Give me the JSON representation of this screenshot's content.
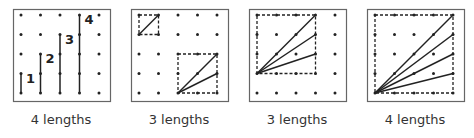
{
  "panels": [
    {
      "caption": "4 lengths",
      "segments": [
        {
          "from": [
            0,
            3
          ],
          "to": [
            0,
            4
          ],
          "label": "1"
        },
        {
          "from": [
            1,
            2
          ],
          "to": [
            1,
            4
          ],
          "label": "2"
        },
        {
          "from": [
            2,
            1
          ],
          "to": [
            2,
            4
          ],
          "label": "3"
        },
        {
          "from": [
            3,
            0
          ],
          "to": [
            3,
            4
          ],
          "label": "4"
        }
      ],
      "squares": []
    },
    {
      "caption": "3 lengths",
      "segments": [
        {
          "from": [
            0,
            1
          ],
          "to": [
            1,
            0
          ]
        },
        {
          "from": [
            2,
            4
          ],
          "to": [
            4,
            2
          ]
        },
        {
          "from": [
            2,
            4
          ],
          "to": [
            4,
            3
          ]
        }
      ],
      "squares": [
        {
          "from": [
            0,
            0
          ],
          "to": [
            1,
            1
          ]
        },
        {
          "from": [
            2,
            2
          ],
          "to": [
            4,
            4
          ]
        }
      ]
    },
    {
      "caption": "3 lengths",
      "segments": [
        {
          "from": [
            0,
            3
          ],
          "to": [
            3,
            0
          ]
        },
        {
          "from": [
            0,
            3
          ],
          "to": [
            3,
            1
          ]
        },
        {
          "from": [
            0,
            3
          ],
          "to": [
            3,
            2
          ]
        }
      ],
      "squares": [
        {
          "from": [
            0,
            0
          ],
          "to": [
            3,
            3
          ]
        }
      ]
    },
    {
      "caption": "4 lengths",
      "segments": [
        {
          "from": [
            0,
            4
          ],
          "to": [
            4,
            0
          ]
        },
        {
          "from": [
            0,
            4
          ],
          "to": [
            4,
            1
          ]
        },
        {
          "from": [
            0,
            4
          ],
          "to": [
            4,
            2
          ]
        },
        {
          "from": [
            0,
            4
          ],
          "to": [
            4,
            3
          ]
        }
      ],
      "squares": [
        {
          "from": [
            0,
            0
          ],
          "to": [
            4,
            4
          ]
        }
      ]
    }
  ],
  "grid": {
    "rows": 5,
    "cols": 5
  }
}
